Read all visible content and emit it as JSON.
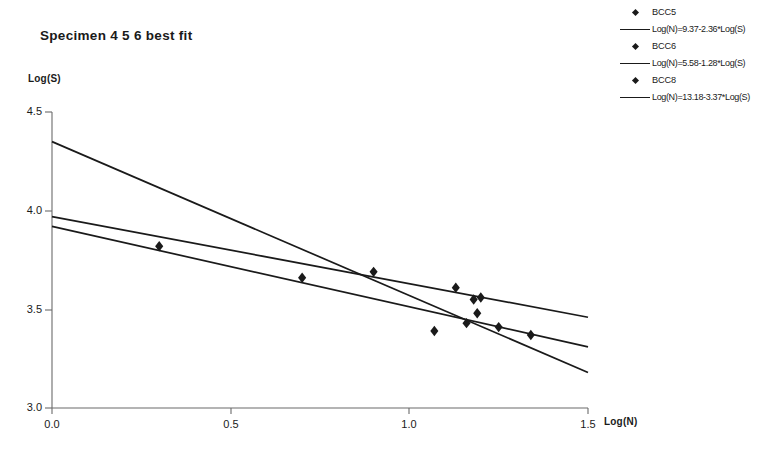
{
  "title": "Specimen  4 5 6 best fit",
  "axes": {
    "ylabel": "Log(S)",
    "xlabel": "Log(N)",
    "yticks": [
      "4.5",
      "4.0",
      "3.5",
      "3.0"
    ],
    "xticks": [
      "0.0",
      "0.5",
      "1.0",
      "1.5"
    ]
  },
  "legend": [
    {
      "kind": "marker",
      "label": "BCC5"
    },
    {
      "kind": "line",
      "label": "Log(N)=9.37-2.36*Log(S)"
    },
    {
      "kind": "marker",
      "label": "BCC6"
    },
    {
      "kind": "line",
      "label": "Log(N)=5.58-1.28*Log(S)"
    },
    {
      "kind": "marker",
      "label": "BCC8"
    },
    {
      "kind": "line",
      "label": "Log(N)=13.18-3.37*Log(S)"
    }
  ],
  "chart_data": {
    "type": "scatter",
    "title": "Specimen  4 5 6 best fit",
    "xlabel": "Log(N)",
    "ylabel": "Log(S)",
    "xlim": [
      0.0,
      1.5
    ],
    "ylim": [
      3.0,
      4.5
    ],
    "grid": false,
    "legend_position": "right",
    "marker": "diamond",
    "marker_color": "#1a1a1a",
    "line_color": "#1a1a1a",
    "series": [
      {
        "name": "BCC5",
        "type": "scatter",
        "points": [
          {
            "x": 0.3,
            "y": 3.82
          },
          {
            "x": 0.7,
            "y": 3.66
          },
          {
            "x": 0.9,
            "y": 3.69
          },
          {
            "x": 1.13,
            "y": 3.61
          }
        ]
      },
      {
        "name": "BCC6",
        "type": "scatter",
        "points": [
          {
            "x": 1.07,
            "y": 3.39
          },
          {
            "x": 1.16,
            "y": 3.43
          },
          {
            "x": 1.19,
            "y": 3.48
          },
          {
            "x": 1.18,
            "y": 3.55
          }
        ]
      },
      {
        "name": "BCC8",
        "type": "scatter",
        "points": [
          {
            "x": 1.2,
            "y": 3.56
          },
          {
            "x": 1.25,
            "y": 3.41
          },
          {
            "x": 1.34,
            "y": 3.37
          }
        ]
      },
      {
        "name": "Log(N)=9.37-2.36*Log(S)",
        "type": "line",
        "intercept": 3.97,
        "slope": -0.34,
        "endpoints": [
          {
            "x": 0.0,
            "y": 3.97
          },
          {
            "x": 1.5,
            "y": 3.46
          }
        ]
      },
      {
        "name": "Log(N)=5.58-1.28*Log(S)",
        "type": "line",
        "intercept": 3.92,
        "slope": -0.41,
        "endpoints": [
          {
            "x": 0.0,
            "y": 3.92
          },
          {
            "x": 1.5,
            "y": 3.31
          }
        ]
      },
      {
        "name": "Log(N)=13.18-3.37*Log(S)",
        "type": "line",
        "intercept": 4.35,
        "slope": -0.78,
        "endpoints": [
          {
            "x": 0.0,
            "y": 4.35
          },
          {
            "x": 1.5,
            "y": 3.18
          }
        ]
      }
    ]
  }
}
